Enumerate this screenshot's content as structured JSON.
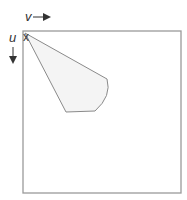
{
  "diagram": {
    "axes": {
      "v_label": "v",
      "u_label": "u",
      "origin_marker": "x"
    },
    "frame": {
      "x": 23,
      "y": 31,
      "width": 158,
      "height": 162,
      "stroke": "#9a9a9a"
    },
    "sector": {
      "apex": [
        25,
        33
      ],
      "fill": "#f4f4f4",
      "stroke": "#8a8a8a",
      "description": "fan-shaped sector (field of view) originating at top-left origin"
    },
    "colors": {
      "ink": "#333333",
      "frame": "#9a9a9a",
      "sector_fill": "#f4f4f4"
    }
  }
}
